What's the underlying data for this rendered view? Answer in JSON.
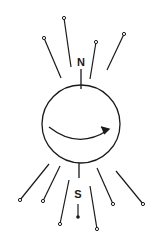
{
  "diagram": {
    "colors": {
      "stroke": "#1a1a1a",
      "background": "#ffffff"
    },
    "sphere": {
      "cx": 81,
      "cy": 124,
      "r": 39
    },
    "rotation_arrow": {
      "path": "M49,127 Q78,150 108,130",
      "arrowhead": "M101,127 L109,129 L104,134"
    },
    "poles": {
      "north": {
        "label": "N",
        "x": 81,
        "y": 66,
        "tick": [
          81,
          69,
          81,
          89
        ]
      },
      "south": {
        "label": "S",
        "x": 78,
        "y": 198,
        "tick": [
          79,
          163,
          79,
          178
        ],
        "stem": [
          78,
          204,
          78,
          216
        ],
        "dot": [
          78,
          217
        ]
      }
    },
    "field_lines": [
      {
        "id": "nw-outer",
        "x1": 44,
        "y1": 38,
        "x2": 61,
        "y2": 78
      },
      {
        "id": "nw-inner",
        "x1": 64,
        "y1": 18,
        "x2": 71,
        "y2": 67
      },
      {
        "id": "ne-inner",
        "x1": 96,
        "y1": 42,
        "x2": 90,
        "y2": 79
      },
      {
        "id": "ne-outer",
        "x1": 124,
        "y1": 34,
        "x2": 107,
        "y2": 70
      },
      {
        "id": "sw-outer",
        "x1": 49,
        "y1": 164,
        "x2": 20,
        "y2": 200
      },
      {
        "id": "sw-mid",
        "x1": 60,
        "y1": 166,
        "x2": 43,
        "y2": 201
      },
      {
        "id": "sw-inner",
        "x1": 69,
        "y1": 180,
        "x2": 60,
        "y2": 224
      },
      {
        "id": "se-inner",
        "x1": 90,
        "y1": 186,
        "x2": 97,
        "y2": 229
      },
      {
        "id": "se-mid",
        "x1": 97,
        "y1": 168,
        "x2": 113,
        "y2": 204
      },
      {
        "id": "se-outer",
        "x1": 116,
        "y1": 171,
        "x2": 143,
        "y2": 204
      }
    ]
  }
}
